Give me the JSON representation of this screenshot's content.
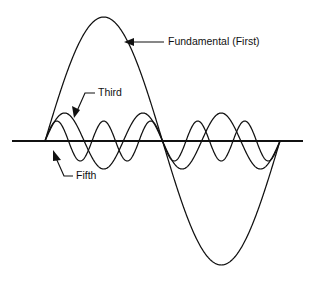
{
  "figure": {
    "background_color": "#ffffff",
    "stroke_color": "#111111",
    "width": 315,
    "height": 281
  },
  "annotations": {
    "fundamental": {
      "label": "Fundamental (First)",
      "text_x": 168,
      "text_y": 45,
      "arrow_style": "horizontal-left-arrow"
    },
    "third": {
      "label": "Third",
      "text_x": 98,
      "text_y": 96,
      "arrow_style": "elbow-down-left-arrow"
    },
    "fifth": {
      "label": "Fifth",
      "text_x": 76,
      "text_y": 179,
      "arrow_style": "elbow-up-right-arrow"
    }
  },
  "chart_data": {
    "type": "line",
    "xlabel": "",
    "ylabel": "",
    "grid": false,
    "legend": "annotations",
    "axis": {
      "baseline_y_px": 141,
      "x_start_px": 12,
      "x_end_px": 303,
      "wave_start_px": 45,
      "wave_end_px": 280,
      "period_px": 235
    },
    "x": [
      0,
      0.05,
      0.1,
      0.15,
      0.2,
      0.25,
      0.3,
      0.35,
      0.4,
      0.45,
      0.5,
      0.55,
      0.6,
      0.65,
      0.7,
      0.75,
      0.8,
      0.85,
      0.9,
      0.95,
      1
    ],
    "xlim": [
      0,
      1
    ],
    "ylim": [
      -1.05,
      1.05
    ],
    "series": [
      {
        "name": "Fundamental (First)",
        "harmonic": 1,
        "amplitude": 1.0,
        "amplitude_px": 124,
        "peak_x_px": 101,
        "peak_y_px": 17,
        "trough_x_px": 222,
        "trough_y_px": 266,
        "zero_crossing_px": 163,
        "values": [
          0,
          0.309,
          0.588,
          0.809,
          0.951,
          1,
          0.951,
          0.809,
          0.588,
          0.309,
          0,
          -0.309,
          -0.588,
          -0.809,
          -0.951,
          -1,
          -0.951,
          -0.809,
          -0.588,
          -0.309,
          0
        ]
      },
      {
        "name": "Third",
        "harmonic": 3,
        "amplitude": 0.226,
        "amplitude_px": 28,
        "values": [
          0,
          0.809,
          0.951,
          0.309,
          -0.588,
          -1,
          -0.588,
          0.309,
          0.951,
          0.809,
          0,
          -0.809,
          -0.951,
          -0.309,
          0.588,
          1,
          0.588,
          -0.309,
          -0.951,
          -0.809,
          0
        ]
      },
      {
        "name": "Fifth",
        "harmonic": 5,
        "amplitude": 0.161,
        "amplitude_px": 20,
        "values": [
          0,
          1,
          0,
          -1,
          0,
          1,
          0,
          -1,
          0,
          1,
          0,
          -1,
          0,
          1,
          0,
          -1,
          0,
          1,
          0,
          -1,
          0
        ]
      }
    ]
  }
}
